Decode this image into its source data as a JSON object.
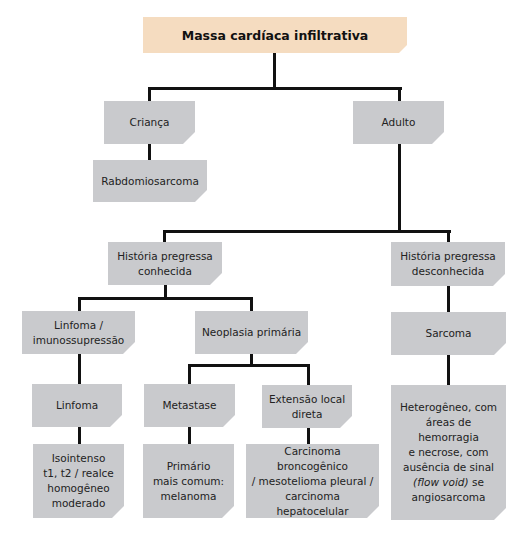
{
  "title": "Massa cardíaca infiltrativa",
  "colors": {
    "root_fill": "#f5dcc0",
    "node_fill": "#c9cacd",
    "connector": "#111111"
  },
  "nodes": {
    "root": {
      "label": "Massa cardíaca infiltrativa"
    },
    "crianca": {
      "label": "Criança"
    },
    "rabdomiosarcoma": {
      "label": "Rabdomiosarcoma"
    },
    "adulto": {
      "label": "Adulto"
    },
    "historia_conhecida": {
      "line1": "História pregressa",
      "line2": "conhecida"
    },
    "historia_desconhecida": {
      "line1": "História pregressa",
      "line2": "desconhecida"
    },
    "linfoma_imuno": {
      "line1": "Linfoma /",
      "line2": "imunossupressão"
    },
    "neoplasia_primaria": {
      "label": "Neoplasia primária"
    },
    "sarcoma": {
      "label": "Sarcoma"
    },
    "linfoma": {
      "label": "Linfoma"
    },
    "metastase": {
      "label": "Metastase"
    },
    "extensao_local": {
      "line1": "Extensão local",
      "line2": "direta"
    },
    "isointenso": {
      "line1": "Isointenso",
      "line2": "t1, t2 / realce",
      "line3": "homogêneo",
      "line4": "moderado"
    },
    "primario": {
      "line1": "Primário",
      "line2": "mais comum:",
      "line3": "melanoma"
    },
    "carcinoma": {
      "line1": "Carcinoma broncogênico",
      "line2": "/ mesotelioma pleural /",
      "line3": "carcinoma hepatocelular"
    },
    "heterogeneo": {
      "line1": "Heterogêneo, com",
      "line2": "áreas de hemorragia",
      "line3": "e necrose, com",
      "line4": "ausência de sinal",
      "line5_italic": "(flow void)",
      "line5_rest": " se",
      "line6": "angiosarcoma"
    }
  },
  "edges": [
    [
      "root",
      "crianca"
    ],
    [
      "root",
      "adulto"
    ],
    [
      "crianca",
      "rabdomiosarcoma"
    ],
    [
      "adulto",
      "historia_conhecida"
    ],
    [
      "adulto",
      "historia_desconhecida"
    ],
    [
      "historia_conhecida",
      "linfoma_imuno"
    ],
    [
      "historia_conhecida",
      "neoplasia_primaria"
    ],
    [
      "historia_desconhecida",
      "sarcoma"
    ],
    [
      "linfoma_imuno",
      "linfoma"
    ],
    [
      "linfoma",
      "isointenso"
    ],
    [
      "neoplasia_primaria",
      "metastase"
    ],
    [
      "neoplasia_primaria",
      "extensao_local"
    ],
    [
      "metastase",
      "primario"
    ],
    [
      "extensao_local",
      "carcinoma"
    ],
    [
      "sarcoma",
      "heterogeneo"
    ]
  ]
}
